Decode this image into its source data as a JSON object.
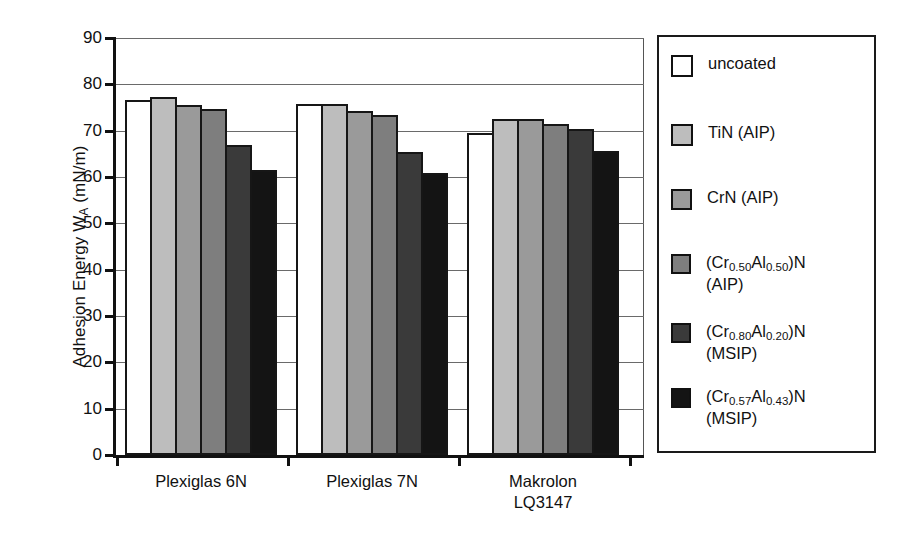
{
  "chart_data": {
    "type": "bar",
    "title": "",
    "xlabel": "",
    "ylabel": "Adhesion Energy W_A (mN/m)",
    "ylabel_parts": {
      "main": "Adhesion Energy W",
      "sub": "A",
      "unit": " (mN/m)"
    },
    "ylim": [
      0,
      90
    ],
    "ytick_step": 10,
    "yticks": [
      "90",
      "80",
      "70",
      "60",
      "50",
      "40",
      "30",
      "20",
      "10",
      "0"
    ],
    "grid": "horizontal",
    "legend_position": "right-outside",
    "categories": [
      "Plexiglas 6N",
      "Plexiglas 7N",
      "Makrolon\nLQ3147"
    ],
    "series": [
      {
        "name": "uncoated",
        "label_line1": "uncoated",
        "label_line2": "",
        "color": "#ffffff",
        "values": [
          76.7,
          75.7,
          69.4
        ]
      },
      {
        "name": "TiN (AIP)",
        "label_line1": "TiN (AIP)",
        "label_line2": "",
        "color": "#bdbdbd",
        "values": [
          77.3,
          75.8,
          72.5
        ]
      },
      {
        "name": "CrN (AIP)",
        "label_line1": "CrN (AIP)",
        "label_line2": "",
        "color": "#9a9a9a",
        "values": [
          75.6,
          74.2,
          72.5
        ]
      },
      {
        "name": "(Cr0.50Al0.50)N (AIP)",
        "label_prefix": "(Cr",
        "sub1": "0.50",
        "label_mid": "Al",
        "sub2": "0.50",
        "label_suffix": ")N",
        "label_line2": "(AIP)",
        "color": "#7e7e7e",
        "values": [
          74.6,
          73.3,
          71.4
        ]
      },
      {
        "name": "(Cr0.80Al0.20)N (MSIP)",
        "label_prefix": "(Cr",
        "sub1": "0.80",
        "label_mid": "Al",
        "sub2": "0.20",
        "label_suffix": ")N",
        "label_line2": "(MSIP)",
        "color": "#3a3a3a",
        "values": [
          67.0,
          65.3,
          70.4
        ]
      },
      {
        "name": "(Cr0.57Al0.43)N (MSIP)",
        "label_prefix": "(Cr",
        "sub1": "0.57",
        "label_mid": "Al",
        "sub2": "0.43",
        "label_suffix": ")N",
        "label_line2": "(MSIP)",
        "color": "#141414",
        "values": [
          61.6,
          60.9,
          65.7
        ]
      }
    ]
  },
  "legend": {
    "items": [
      {
        "text": "uncoated",
        "color": "#ffffff"
      },
      {
        "text": "TiN (AIP)",
        "color": "#bdbdbd"
      },
      {
        "text": "CrN (AIP)",
        "color": "#9a9a9a"
      },
      {
        "text": "(Cr0.50Al0.50)N\n(AIP)",
        "color": "#7e7e7e"
      },
      {
        "text": "(Cr0.80Al0.20)N\n(MSIP)",
        "color": "#3a3a3a"
      },
      {
        "text": "(Cr0.57Al0.43)N\n(MSIP)",
        "color": "#141414"
      }
    ]
  }
}
